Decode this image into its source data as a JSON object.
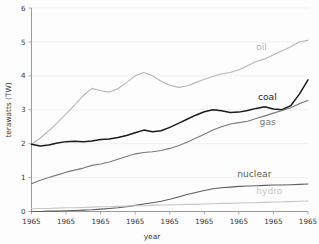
{
  "chart_data": {
    "type": "line",
    "title": "",
    "xlabel": "year",
    "ylabel": "terawatts (TW)",
    "xlim": [
      0,
      8
    ],
    "ylim": [
      0,
      6
    ],
    "grid": true,
    "legend_position": "inline-right",
    "x_tick_labels": [
      "1965",
      "1965",
      "1965",
      "1965",
      "1965",
      "1965",
      "1965",
      "1965",
      "1965"
    ],
    "y_tick_labels": [
      "0",
      "1",
      "2",
      "3",
      "4",
      "5",
      "6"
    ],
    "y_ticks": [
      0,
      1,
      2,
      3,
      4,
      5,
      6
    ],
    "x": [
      0,
      0.25,
      0.5,
      0.75,
      1,
      1.25,
      1.5,
      1.75,
      2,
      2.25,
      2.5,
      2.75,
      3,
      3.25,
      3.5,
      3.75,
      4,
      4.25,
      4.5,
      4.75,
      5,
      5.25,
      5.5,
      5.75,
      6,
      6.25,
      6.5,
      6.75,
      7,
      7.25,
      7.5,
      7.75,
      8
    ],
    "series": [
      {
        "name": "oil",
        "color": "#b6b6b6",
        "label": "oil",
        "values": [
          1.98,
          2.16,
          2.38,
          2.62,
          2.88,
          3.14,
          3.42,
          3.63,
          3.56,
          3.52,
          3.62,
          3.8,
          4.0,
          4.1,
          4.0,
          3.84,
          3.72,
          3.66,
          3.7,
          3.8,
          3.9,
          3.98,
          4.06,
          4.1,
          4.18,
          4.3,
          4.42,
          4.5,
          4.62,
          4.74,
          4.86,
          5.0,
          5.05
        ]
      },
      {
        "name": "coal",
        "color": "#1c1c1c",
        "label": "coal",
        "values": [
          1.98,
          1.93,
          1.96,
          2.02,
          2.06,
          2.07,
          2.06,
          2.08,
          2.12,
          2.14,
          2.18,
          2.24,
          2.32,
          2.4,
          2.35,
          2.38,
          2.48,
          2.6,
          2.72,
          2.84,
          2.94,
          3.0,
          2.97,
          2.92,
          2.93,
          2.98,
          3.04,
          3.09,
          3.02,
          3.0,
          3.12,
          3.46,
          3.88
        ]
      },
      {
        "name": "gas",
        "color": "#7a7a7a",
        "label": "gas",
        "values": [
          0.82,
          0.92,
          1.0,
          1.08,
          1.16,
          1.22,
          1.28,
          1.36,
          1.4,
          1.46,
          1.54,
          1.62,
          1.7,
          1.74,
          1.76,
          1.8,
          1.86,
          1.94,
          2.04,
          2.16,
          2.28,
          2.4,
          2.5,
          2.58,
          2.62,
          2.66,
          2.74,
          2.82,
          2.9,
          2.98,
          3.06,
          3.18,
          3.27
        ]
      },
      {
        "name": "nuclear",
        "color": "#5e5e5e",
        "label": "nuclear",
        "values": [
          0.0,
          0.0,
          0.01,
          0.01,
          0.02,
          0.03,
          0.04,
          0.05,
          0.07,
          0.09,
          0.11,
          0.14,
          0.18,
          0.22,
          0.26,
          0.3,
          0.36,
          0.43,
          0.5,
          0.56,
          0.62,
          0.67,
          0.7,
          0.72,
          0.74,
          0.75,
          0.76,
          0.77,
          0.78,
          0.78,
          0.79,
          0.8,
          0.81
        ]
      },
      {
        "name": "hydro",
        "color": "#c6c6c6",
        "label": "hydro",
        "values": [
          0.08,
          0.09,
          0.09,
          0.1,
          0.11,
          0.11,
          0.12,
          0.13,
          0.14,
          0.14,
          0.15,
          0.16,
          0.17,
          0.17,
          0.18,
          0.19,
          0.19,
          0.2,
          0.21,
          0.21,
          0.22,
          0.23,
          0.24,
          0.24,
          0.25,
          0.26,
          0.26,
          0.27,
          0.28,
          0.28,
          0.29,
          0.3,
          0.31
        ]
      }
    ],
    "series_label_positions": [
      {
        "name": "oil",
        "x": 6.5,
        "y": 4.75
      },
      {
        "name": "coal",
        "x": 6.55,
        "y": 3.28
      },
      {
        "name": "gas",
        "x": 6.6,
        "y": 2.55
      },
      {
        "name": "nuclear",
        "x": 5.95,
        "y": 1.02
      },
      {
        "name": "hydro",
        "x": 6.5,
        "y": 0.52
      }
    ]
  }
}
